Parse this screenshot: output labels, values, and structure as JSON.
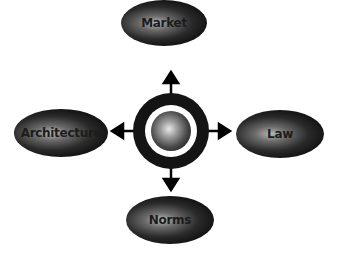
{
  "diagram": {
    "type": "hub-and-spoke",
    "center": {
      "label": "",
      "shape": "sphere-in-ring"
    },
    "nodes": [
      {
        "id": "top",
        "label": "Market",
        "position": "top"
      },
      {
        "id": "left",
        "label": "Architecture",
        "position": "left"
      },
      {
        "id": "right",
        "label": "Law",
        "position": "right"
      },
      {
        "id": "bottom",
        "label": "Norms",
        "position": "bottom"
      }
    ],
    "edges": [
      {
        "from": "center",
        "to": "top"
      },
      {
        "from": "center",
        "to": "left"
      },
      {
        "from": "center",
        "to": "right"
      },
      {
        "from": "center",
        "to": "bottom"
      }
    ],
    "colors": {
      "node_dark": "#111111",
      "ring": "#1a1a1a",
      "arrow": "#000000",
      "background": "#ffffff"
    }
  }
}
